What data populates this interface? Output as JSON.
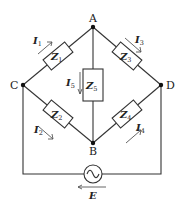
{
  "diagram": {
    "type": "bridge-circuit",
    "nodes": {
      "A": {
        "label": "A"
      },
      "B": {
        "label": "B"
      },
      "C": {
        "label": "C"
      },
      "D": {
        "label": "D"
      }
    },
    "impedances": [
      {
        "id": "Z1",
        "main": "Z",
        "sub": "1",
        "branch": "C-A"
      },
      {
        "id": "Z2",
        "main": "Z",
        "sub": "2",
        "branch": "C-B"
      },
      {
        "id": "Z3",
        "main": "Z",
        "sub": "3",
        "branch": "A-D"
      },
      {
        "id": "Z4",
        "main": "Z",
        "sub": "4",
        "branch": "B-D"
      },
      {
        "id": "Z5",
        "main": "Z",
        "sub": "5",
        "branch": "A-B"
      }
    ],
    "currents": [
      {
        "id": "I1",
        "main": "I",
        "sub": "1",
        "direction": "C to A"
      },
      {
        "id": "I2",
        "main": "I",
        "sub": "2",
        "direction": "C to B"
      },
      {
        "id": "I3",
        "main": "I",
        "sub": "3",
        "direction": "A to D"
      },
      {
        "id": "I4",
        "main": "I",
        "sub": "4",
        "direction": "B to D"
      },
      {
        "id": "I5",
        "main": "I",
        "sub": "5",
        "direction": "A to B"
      }
    ],
    "source": {
      "label": "E",
      "symbol": "ac-voltage-source",
      "arrow_direction": "left"
    }
  }
}
